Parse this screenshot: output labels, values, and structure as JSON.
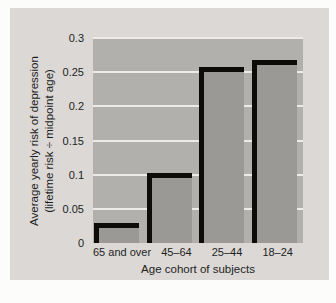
{
  "chart_data": {
    "type": "bar",
    "title": "",
    "categories": [
      "65 and over",
      "45–64",
      "25–44",
      "18–24"
    ],
    "values": [
      0.022,
      0.095,
      0.25,
      0.26
    ],
    "xlabel": "Age cohort of subjects",
    "ylabel": "Average yearly risk of depression (lifetime risk ÷ midpoint age)",
    "ylabel_line1": "Average yearly risk of depression",
    "ylabel_line2": "(lifetime risk ÷ midpoint age)",
    "ylim": [
      0,
      0.3
    ],
    "yticks": [
      "0",
      "0.05",
      "0.1",
      "0.15",
      "0.2",
      "0.25",
      "0.3"
    ],
    "grid": true,
    "legend": false,
    "bar_style": "gray fill with black drop shadow offset up-left"
  },
  "colors": {
    "page_bg": "#fcfcfb",
    "figure_bg": "#dbd8d5",
    "plot_bg": "#b2b0ad",
    "bar_fill": "#9b9996",
    "bar_shadow": "#0d0c0a",
    "gridline": "#edebe8",
    "text": "#1e1e1e"
  }
}
